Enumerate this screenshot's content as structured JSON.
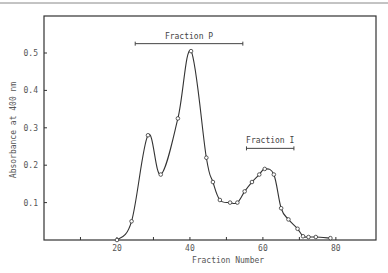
{
  "chart_data": {
    "type": "line",
    "title": "",
    "xlabel": "Fraction Number",
    "ylabel": "Absorbance at 400 nm",
    "xlim": [
      0,
      91
    ],
    "ylim": [
      0,
      0.58
    ],
    "x_ticks": [
      10,
      20,
      30,
      40,
      50,
      60,
      70,
      80
    ],
    "x_tick_labels": [
      "",
      "20",
      "",
      "40",
      "",
      "60",
      "",
      "80"
    ],
    "y_ticks": [
      0.1,
      0.2,
      0.3,
      0.4,
      0.5
    ],
    "y_tick_labels": [
      "0.1",
      "0.2",
      "0.3",
      "0.4",
      "0.5"
    ],
    "grid": false,
    "legend": null,
    "series": [
      {
        "name": "Absorbance",
        "marker": "open-circle",
        "x": [
          20,
          24,
          28.5,
          32,
          36.7,
          40.3,
          44.5,
          46.3,
          48.2,
          51,
          53,
          55,
          57,
          59,
          60.5,
          63,
          65,
          67,
          69.5,
          71,
          72.5,
          74.5,
          78.5
        ],
        "y": [
          0.0,
          0.05,
          0.28,
          0.175,
          0.325,
          0.505,
          0.22,
          0.155,
          0.107,
          0.1,
          0.1,
          0.13,
          0.155,
          0.175,
          0.19,
          0.175,
          0.085,
          0.055,
          0.03,
          0.01,
          0.008,
          0.008,
          0.005
        ]
      }
    ],
    "annotations": [
      {
        "text": "Fraction P",
        "type": "range-bar",
        "x_start": 25,
        "x_end": 54.5,
        "y": 0.525
      },
      {
        "text": "Fraction I",
        "type": "range-bar",
        "x_start": 55.5,
        "x_end": 68.5,
        "y": 0.245
      }
    ]
  }
}
